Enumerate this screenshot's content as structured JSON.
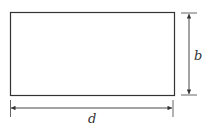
{
  "diagram": {
    "shape": "rectangle",
    "labels": {
      "height": "b",
      "width": "d"
    },
    "colors": {
      "stroke": "#333333",
      "background": "#ffffff"
    }
  }
}
